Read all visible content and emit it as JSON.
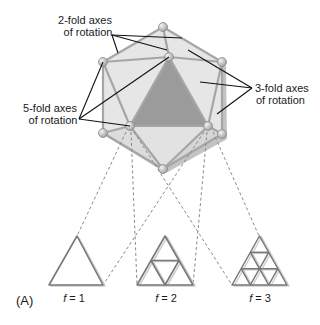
{
  "figure": {
    "panel_label": "(A)",
    "labels": {
      "two_fold": {
        "line1": "2-fold axes",
        "line2": "of rotation"
      },
      "three_fold": {
        "line1": "3-fold axes",
        "line2": "of rotation"
      },
      "five_fold": {
        "line1": "5-fold axes",
        "line2": "of rotation"
      }
    },
    "triangulation": [
      {
        "label": "f = 1",
        "italic_var": "f",
        "value": "1"
      },
      {
        "label": "f = 2",
        "italic_var": "f",
        "value": "2"
      },
      {
        "label": "f = 3",
        "italic_var": "f",
        "value": "3"
      }
    ],
    "colors": {
      "face_light": "#e6e6e6",
      "face_shadow": "#bdbdbd",
      "face_highlight": "#9b9b9b",
      "edge": "#a6a6a6",
      "vertex": "#c8c8c8",
      "pointer": "#111111",
      "dash": "#8a8a8a",
      "triangle_edge": "#777777"
    }
  }
}
